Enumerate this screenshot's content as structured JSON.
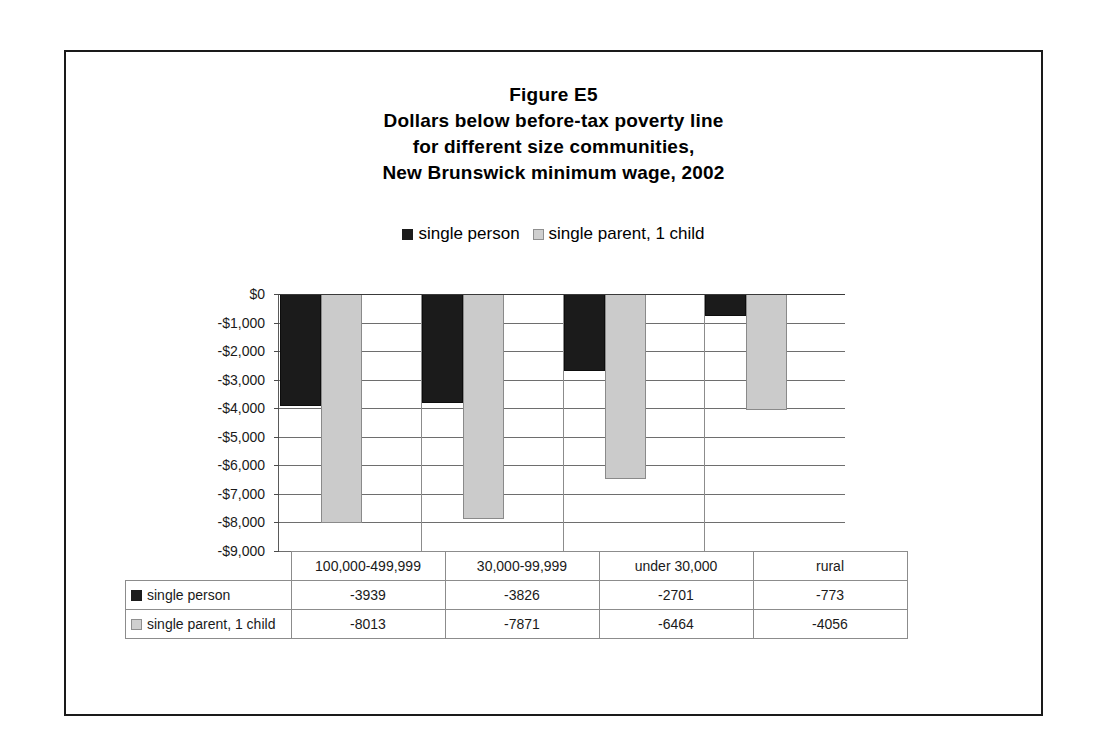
{
  "figure": {
    "title_lines": [
      "Figure E5",
      "Dollars below before-tax poverty line",
      "for different size communities,",
      "New Brunswick minimum wage, 2002"
    ]
  },
  "legend": {
    "entries": [
      {
        "label": "single person",
        "swatch": "dark-square-icon",
        "color": "#1c1c1c"
      },
      {
        "label": "single parent, 1 child",
        "swatch": "light-square-icon",
        "color": "#cfcfcf"
      }
    ]
  },
  "axis": {
    "y_ticks": [
      "$0",
      "-$1,000",
      "-$2,000",
      "-$3,000",
      "-$4,000",
      "-$5,000",
      "-$6,000",
      "-$7,000",
      "-$8,000",
      "-$9,000"
    ],
    "y_values": [
      0,
      -1000,
      -2000,
      -3000,
      -4000,
      -5000,
      -6000,
      -7000,
      -8000,
      -9000
    ]
  },
  "table": {
    "corner_label": "",
    "categories": [
      "100,000-499,999",
      "30,000-99,999",
      "under 30,000",
      "rural"
    ],
    "rows": [
      {
        "label": "single person",
        "swatch": "dark-square-icon",
        "values": [
          "-3939",
          "-3826",
          "-2701",
          "-773"
        ]
      },
      {
        "label": "single parent, 1 child",
        "swatch": "light-square-icon",
        "values": [
          "-8013",
          "-7871",
          "-6464",
          "-4056"
        ]
      }
    ]
  },
  "chart_data": {
    "type": "bar",
    "xlabel": "",
    "ylabel": "",
    "categories": [
      "100,000-499,999",
      "30,000-99,999",
      "under 30,000",
      "rural"
    ],
    "series": [
      {
        "name": "single person",
        "color": "#1c1c1c",
        "values": [
          -3939,
          -3826,
          -2701,
          -773
        ]
      },
      {
        "name": "single parent, 1 child",
        "color": "#cfcfcf",
        "values": [
          -8013,
          -7871,
          -6464,
          -4056
        ]
      }
    ],
    "ylim": [
      -9000,
      0
    ],
    "ytick_step": 1000,
    "ytick_labels": [
      "$0",
      "-$1,000",
      "-$2,000",
      "-$3,000",
      "-$4,000",
      "-$5,000",
      "-$6,000",
      "-$7,000",
      "-$8,000",
      "-$9,000"
    ],
    "grid": true,
    "legend_position": "top-center",
    "data_table_shown": true
  }
}
